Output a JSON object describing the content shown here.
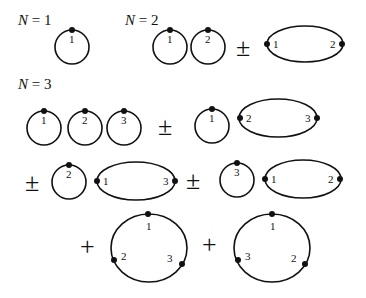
{
  "diagram": {
    "sections": [
      {
        "title_var": "N",
        "title_eq": " = 1"
      },
      {
        "title_var": "N",
        "title_eq": " = 2"
      },
      {
        "title_var": "N",
        "title_eq": " = 3"
      }
    ],
    "operators": {
      "pm": "±",
      "plus": "+"
    },
    "labels": {
      "one": "1",
      "two": "2",
      "three": "3"
    },
    "colors": {
      "stroke": "#111111",
      "background": "#ffffff"
    }
  }
}
